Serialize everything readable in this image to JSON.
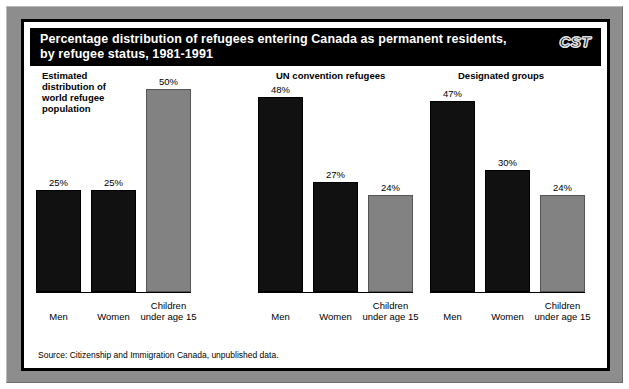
{
  "figure": {
    "title_line1": "Percentage distribution of refugees entering Canada as permanent residents,",
    "title_line2": "by refugee status, 1981-1991",
    "logo": "CST",
    "source": "Source: Citizenship and Immigration Canada, unpublished data."
  },
  "colors": {
    "dark_bar": "#111111",
    "light_bar": "#828282",
    "title_bar": "#000000",
    "frame": "#8d8d8d",
    "plate": "#ffffff"
  },
  "chart_data": {
    "type": "bar",
    "title": "Percentage distribution of refugees entering Canada as permanent residents, by refugee status, 1981-1991",
    "xlabel": "",
    "ylabel": "",
    "ylim": [
      0,
      50
    ],
    "grid": false,
    "legend": "none",
    "value_suffix": "%",
    "categories": [
      "Men",
      "Women",
      "Children under age 15"
    ],
    "category_labels": [
      {
        "line1": "Men",
        "line2": ""
      },
      {
        "line1": "Women",
        "line2": ""
      },
      {
        "line1": "Children",
        "line2": "under age 15"
      }
    ],
    "panels": [
      {
        "name": "estimated-world-refugee-population",
        "title_lines": [
          "Estimated",
          "distribution of",
          "world refugee",
          "population"
        ],
        "values": [
          25,
          25,
          50
        ],
        "value_labels": [
          "25%",
          "25%",
          "50%"
        ],
        "bar_styles": [
          "dark",
          "dark",
          "light"
        ]
      },
      {
        "name": "un-convention-refugees",
        "title_lines": [
          "UN convention refugees"
        ],
        "values": [
          48,
          27,
          24
        ],
        "value_labels": [
          "48%",
          "27%",
          "24%"
        ],
        "bar_styles": [
          "dark",
          "dark",
          "light"
        ]
      },
      {
        "name": "designated-groups",
        "title_lines": [
          "Designated groups"
        ],
        "values": [
          47,
          30,
          24
        ],
        "value_labels": [
          "47%",
          "30%",
          "24%"
        ],
        "bar_styles": [
          "dark",
          "dark",
          "light"
        ]
      }
    ]
  }
}
